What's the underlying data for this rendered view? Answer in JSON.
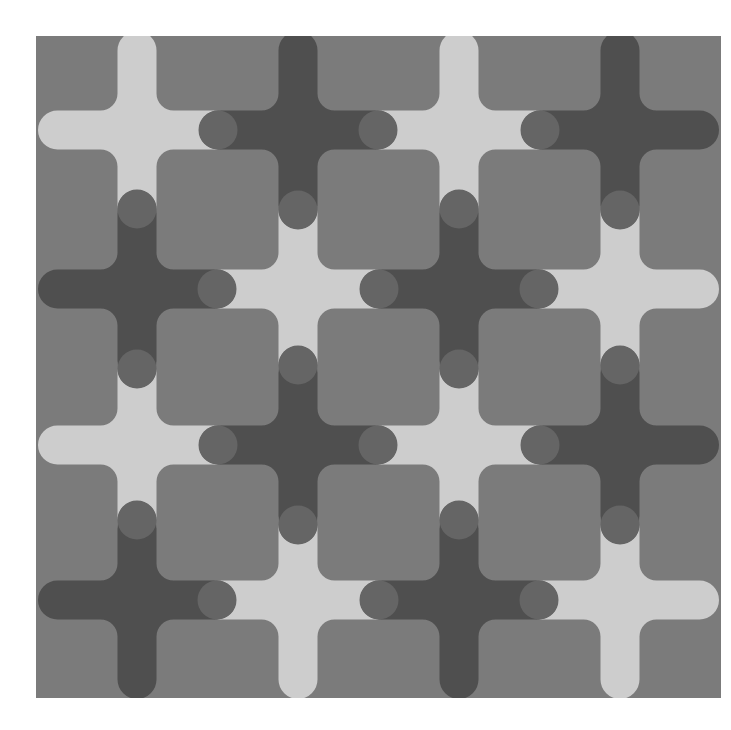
{
  "artwork": {
    "canvas": {
      "width": 731,
      "height": 730,
      "background": "#ffffff"
    },
    "frame": {
      "x": 36,
      "y": 36,
      "width": 685,
      "height": 662,
      "fill": "#7b7b7b"
    },
    "colors": {
      "light_cross": "#cdcdcd",
      "dark_cross": "#4f4f4f",
      "dark_cap": "#656565"
    },
    "geometry": {
      "arm_half_width": 19.5,
      "arm_reach": 99,
      "fillet_radius": 17,
      "cap_offset": 80,
      "cap_radius": 19.5
    },
    "columns": [
      137,
      298,
      459,
      620
    ],
    "rows": [
      130,
      289,
      445,
      600
    ],
    "pattern": [
      [
        "light",
        "dark",
        "light",
        "dark"
      ],
      [
        "dark",
        "light",
        "dark",
        "light"
      ],
      [
        "light",
        "dark",
        "light",
        "dark"
      ],
      [
        "dark",
        "light",
        "dark",
        "light"
      ]
    ]
  }
}
